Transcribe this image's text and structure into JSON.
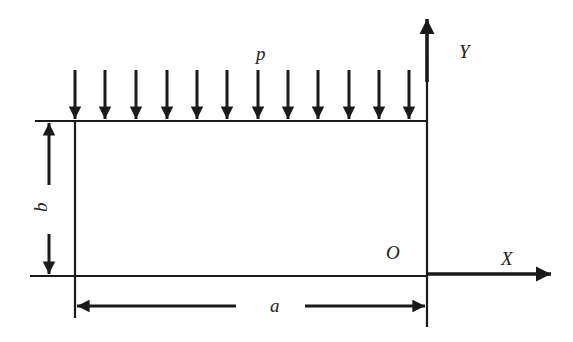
{
  "diagram": {
    "type": "rectangular plate under uniform edge load",
    "labels": {
      "load": "p",
      "y_axis": "Y",
      "x_axis": "X",
      "origin": "O",
      "width": "a",
      "height": "b"
    },
    "colors": {
      "stroke": "#1a1a1a",
      "background": "#ffffff"
    },
    "load_arrows_count": 12
  }
}
